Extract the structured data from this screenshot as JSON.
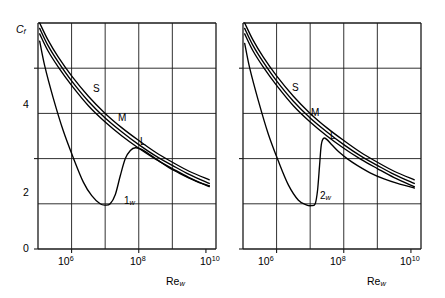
{
  "figure": {
    "panels": [
      {
        "id": "panel-1",
        "axes": {
          "ylabel": "C",
          "ylabel_sub": "f",
          "xlabel": "Re",
          "xlabel_sub": "w",
          "y_ticks": [
            "0",
            "2",
            "4"
          ],
          "y_tick_values": [
            0,
            2,
            4
          ],
          "x_ticks": [
            "10",
            "10",
            "10"
          ],
          "x_tick_exponents": [
            "6",
            "8",
            "10"
          ],
          "x_tick_values": [
            6,
            8,
            10
          ]
        },
        "curve_labels": [
          {
            "text": "S"
          },
          {
            "text": "M"
          },
          {
            "text": "L"
          },
          {
            "text": "1",
            "sub": "w"
          }
        ]
      },
      {
        "id": "panel-2",
        "axes": {
          "ylabel": "",
          "ylabel_sub": "",
          "xlabel": "Re",
          "xlabel_sub": "w",
          "y_ticks": [],
          "y_tick_values": [
            0,
            2,
            4
          ],
          "x_ticks": [
            "10",
            "10",
            "10"
          ],
          "x_tick_exponents": [
            "6",
            "8",
            "10"
          ],
          "x_tick_values": [
            6,
            8,
            10
          ]
        },
        "curve_labels": [
          {
            "text": "S"
          },
          {
            "text": "M"
          },
          {
            "text": "L"
          },
          {
            "text": "2",
            "sub": "w"
          }
        ]
      }
    ]
  },
  "chart_data": [
    {
      "type": "line",
      "title": "",
      "xlabel": "Re_w",
      "ylabel": "C_f",
      "xscale": "log",
      "yscale": "linear",
      "xlim": [
        5.0,
        10.3
      ],
      "ylim": [
        0,
        5
      ],
      "x_ticks": [
        6,
        8,
        10
      ],
      "x_tick_labels": [
        "10^6",
        "10^8",
        "10^10"
      ],
      "y_ticks": [
        0,
        2,
        4
      ],
      "y_tick_labels": [
        "0",
        "2",
        "4"
      ],
      "y_gridlines": [
        0,
        1,
        2,
        3,
        4,
        5
      ],
      "x_gridlines": [
        5.0,
        6.0,
        7.0,
        8.0,
        9.0,
        10.3
      ],
      "grid": true,
      "legend": "inline-annotations",
      "series": [
        {
          "name": "S",
          "label_text": "S",
          "x": [
            5.05,
            5.3,
            5.6,
            6.0,
            6.5,
            7.0,
            7.5,
            8.0,
            8.5,
            9.0,
            9.5,
            10.1
          ],
          "y": [
            5.0,
            4.62,
            4.25,
            3.83,
            3.38,
            3.0,
            2.68,
            2.4,
            2.14,
            1.92,
            1.72,
            1.53
          ]
        },
        {
          "name": "M",
          "label_text": "M",
          "x": [
            5.05,
            5.3,
            5.6,
            6.0,
            6.5,
            7.0,
            7.5,
            8.0,
            8.5,
            9.0,
            9.5,
            10.1
          ],
          "y": [
            4.88,
            4.5,
            4.14,
            3.72,
            3.27,
            2.9,
            2.59,
            2.31,
            2.06,
            1.85,
            1.65,
            1.45
          ]
        },
        {
          "name": "L",
          "label_text": "L",
          "x": [
            5.05,
            5.3,
            5.6,
            6.0,
            6.5,
            7.0,
            7.5,
            8.0,
            8.5,
            9.0,
            9.5,
            10.1
          ],
          "y": [
            4.76,
            4.38,
            4.03,
            3.62,
            3.17,
            2.81,
            2.5,
            2.23,
            1.99,
            1.78,
            1.58,
            1.38
          ]
        },
        {
          "name": "1_w",
          "label_text": "1_w",
          "note": "laminar-transition curve, broad gradual hump",
          "x": [
            5.05,
            5.2,
            5.45,
            5.75,
            6.05,
            6.35,
            6.6,
            6.85,
            7.0,
            7.15,
            7.3,
            7.45,
            7.6,
            7.75,
            7.9,
            8.1,
            8.35,
            8.6,
            8.9,
            9.2,
            9.5,
            9.8,
            10.1
          ],
          "y": [
            4.6,
            4.05,
            3.35,
            2.62,
            2.02,
            1.48,
            1.18,
            1.0,
            0.97,
            1.0,
            1.2,
            1.62,
            2.0,
            2.18,
            2.24,
            2.2,
            2.08,
            1.95,
            1.8,
            1.68,
            1.57,
            1.47,
            1.4
          ]
        }
      ]
    },
    {
      "type": "line",
      "title": "",
      "xlabel": "Re_w",
      "ylabel": "C_f",
      "xscale": "log",
      "yscale": "linear",
      "xlim": [
        5.0,
        10.3
      ],
      "ylim": [
        0,
        5
      ],
      "x_ticks": [
        6,
        8,
        10
      ],
      "x_tick_labels": [
        "10^6",
        "10^8",
        "10^10"
      ],
      "y_ticks": [
        0,
        2,
        4
      ],
      "y_tick_labels": [
        "0",
        "2",
        "4"
      ],
      "y_gridlines": [
        0,
        1,
        2,
        3,
        4,
        5
      ],
      "x_gridlines": [
        5.0,
        6.0,
        7.0,
        8.0,
        9.0,
        10.3
      ],
      "grid": true,
      "legend": "inline-annotations",
      "series": [
        {
          "name": "S",
          "label_text": "S",
          "x": [
            5.05,
            5.3,
            5.6,
            6.0,
            6.5,
            7.0,
            7.5,
            8.0,
            8.5,
            9.0,
            9.5,
            10.1
          ],
          "y": [
            5.0,
            4.62,
            4.25,
            3.83,
            3.38,
            3.0,
            2.68,
            2.4,
            2.14,
            1.92,
            1.72,
            1.53
          ]
        },
        {
          "name": "M",
          "label_text": "M",
          "x": [
            5.05,
            5.3,
            5.6,
            6.0,
            6.5,
            7.0,
            7.5,
            8.0,
            8.5,
            9.0,
            9.5,
            10.1
          ],
          "y": [
            4.88,
            4.5,
            4.14,
            3.72,
            3.27,
            2.9,
            2.59,
            2.31,
            2.06,
            1.85,
            1.65,
            1.45
          ]
        },
        {
          "name": "L",
          "label_text": "L",
          "x": [
            5.05,
            5.3,
            5.6,
            6.0,
            6.5,
            7.0,
            7.5,
            8.0,
            8.5,
            9.0,
            9.5,
            10.1
          ],
          "y": [
            4.76,
            4.38,
            4.03,
            3.62,
            3.17,
            2.81,
            2.5,
            2.23,
            1.99,
            1.78,
            1.58,
            1.38
          ]
        },
        {
          "name": "2_w",
          "label_text": "2_w",
          "note": "laminar-transition curve, sharp near-vertical transition",
          "x": [
            5.05,
            5.2,
            5.45,
            5.75,
            6.05,
            6.35,
            6.65,
            6.9,
            7.05,
            7.15,
            7.22,
            7.28,
            7.33,
            7.4,
            7.5,
            7.65,
            7.85,
            8.1,
            8.4,
            8.8,
            9.2,
            9.6,
            10.1
          ],
          "y": [
            4.55,
            4.0,
            3.3,
            2.55,
            1.95,
            1.42,
            1.08,
            0.97,
            0.96,
            1.0,
            1.3,
            1.85,
            2.3,
            2.45,
            2.42,
            2.3,
            2.15,
            2.0,
            1.85,
            1.68,
            1.55,
            1.45,
            1.35
          ]
        }
      ]
    }
  ]
}
